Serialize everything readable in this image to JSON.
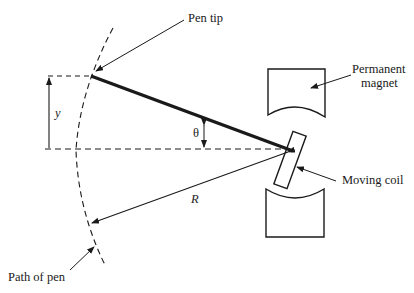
{
  "diagram": {
    "type": "galvanometer-pen-recorder-geometry",
    "labels": {
      "pen_tip": "Pen tip",
      "permanent_magnet_line1": "Permanent",
      "permanent_magnet_line2": "magnet",
      "moving_coil": "Moving coil",
      "path_of_pen": "Path of pen",
      "y": "y",
      "theta": "θ",
      "R": "R"
    },
    "colors": {
      "ink": "#1a1a1a",
      "background": "#ffffff"
    }
  }
}
